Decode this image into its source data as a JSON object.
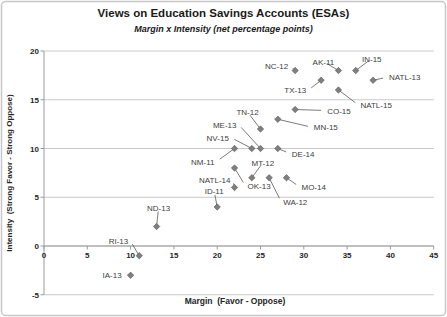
{
  "chart_data": {
    "type": "scatter",
    "title": "Views on Education Savings Accounts (ESAs)",
    "subtitle": "Margin x Intensity (net percentage points)",
    "xlabel": "Margin  (Favor - Oppose)",
    "ylabel": "Intensity  (Strong Favor - Strong Oppose)",
    "xlim": [
      0,
      45
    ],
    "ylim": [
      -5,
      20
    ],
    "xticks": [
      0,
      5,
      10,
      15,
      20,
      25,
      30,
      35,
      40,
      45
    ],
    "yticks": [
      20,
      15,
      10,
      5,
      0,
      -5
    ],
    "grid": "horizontal",
    "legend": "none",
    "marker": "diamond",
    "points": [
      {
        "label": "NC-12",
        "x": 29,
        "y": 18,
        "label_offset": {
          "dx": -7,
          "dy": -2,
          "anchor": "end"
        }
      },
      {
        "label": "AK-11",
        "x": 34,
        "y": 18,
        "label_offset": {
          "dx": -15,
          "dy": -6,
          "anchor": "middle"
        }
      },
      {
        "label": "IN-15",
        "x": 36,
        "y": 18,
        "label_offset": {
          "dx": 16,
          "dy": -9,
          "anchor": "middle"
        }
      },
      {
        "label": "NATL-13",
        "x": 38,
        "y": 17,
        "label_offset": {
          "dx": 16,
          "dy": 0,
          "anchor": "start"
        }
      },
      {
        "label": "TX-13",
        "x": 32,
        "y": 17,
        "label_offset": {
          "dx": -15,
          "dy": 13,
          "anchor": "end"
        }
      },
      {
        "label": "NATL-15",
        "x": 34,
        "y": 16,
        "label_offset": {
          "dx": 22,
          "dy": 18,
          "anchor": "start"
        }
      },
      {
        "label": "CO-15",
        "x": 29,
        "y": 14,
        "label_offset": {
          "dx": 32,
          "dy": 4,
          "anchor": "start"
        }
      },
      {
        "label": "MN-15",
        "x": 27,
        "y": 13,
        "label_offset": {
          "dx": 36,
          "dy": 11,
          "anchor": "start"
        }
      },
      {
        "label": "TN-12",
        "x": 25,
        "y": 12,
        "label_offset": {
          "dx": -13,
          "dy": -14,
          "anchor": "middle"
        }
      },
      {
        "label": "ME-13",
        "x": 25,
        "y": 10,
        "label_offset": {
          "dx": -24,
          "dy": -21,
          "anchor": "end"
        }
      },
      {
        "label": "NV-15",
        "x": 24,
        "y": 10,
        "label_offset": {
          "dx": -23,
          "dy": -8,
          "anchor": "end"
        }
      },
      {
        "label": "NM-11",
        "x": 22,
        "y": 10,
        "label_offset": {
          "dx": -20,
          "dy": 16,
          "anchor": "end"
        }
      },
      {
        "label": "DE-14",
        "x": 27,
        "y": 10,
        "label_offset": {
          "dx": 14,
          "dy": 8,
          "anchor": "start"
        }
      },
      {
        "label": "MT-12",
        "x": 24,
        "y": 7,
        "label_offset": {
          "dx": 11,
          "dy": -12,
          "anchor": "middle"
        }
      },
      {
        "label": "OK-13",
        "x": 22,
        "y": 8,
        "label_offset": {
          "dx": 13,
          "dy": 21,
          "anchor": "start"
        }
      },
      {
        "label": "NATL-14",
        "x": 22,
        "y": 6,
        "label_offset": {
          "dx": -4,
          "dy": -5,
          "anchor": "end"
        }
      },
      {
        "label": "WA-12",
        "x": 26,
        "y": 7,
        "label_offset": {
          "dx": 14,
          "dy": 27,
          "anchor": "start"
        }
      },
      {
        "label": "MO-14",
        "x": 28,
        "y": 7,
        "label_offset": {
          "dx": 15,
          "dy": 12,
          "anchor": "start"
        }
      },
      {
        "label": "ID-11",
        "x": 20,
        "y": 4,
        "label_offset": {
          "dx": -3,
          "dy": -13,
          "anchor": "middle"
        }
      },
      {
        "label": "ND-13",
        "x": 13,
        "y": 2,
        "label_offset": {
          "dx": 2,
          "dy": -16,
          "anchor": "middle"
        }
      },
      {
        "label": "RI-13",
        "x": 11,
        "y": -1,
        "label_offset": {
          "dx": -11,
          "dy": -12,
          "anchor": "end"
        }
      },
      {
        "label": "IA-13",
        "x": 10,
        "y": -3,
        "label_offset": {
          "dx": -9,
          "dy": 3,
          "anchor": "end"
        }
      }
    ],
    "style": {
      "marker_fill": "#7f7f7f",
      "marker_edge": "#595959",
      "gridline_color": "#c9c9c9",
      "axis_color": "#9a9a9a",
      "border_color": "#c8c8c8",
      "tick_label_color": "#262626",
      "point_label_color": "#404040",
      "callout_color": "#595959"
    }
  }
}
